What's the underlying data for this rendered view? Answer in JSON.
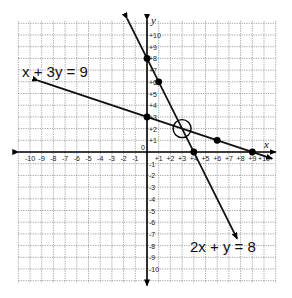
{
  "graph": {
    "x_axis_label": "x",
    "y_axis_label": "y",
    "x_range": [
      -10,
      10
    ],
    "y_range": [
      -10,
      10
    ],
    "x_ticks": [
      "-10",
      "-9",
      "-8",
      "-7",
      "-6",
      "-5",
      "-4",
      "-3",
      "-2",
      "-1",
      "+1",
      "+2",
      "+3",
      "+4",
      "+5",
      "+6",
      "+7",
      "+8",
      "+9",
      "+10"
    ],
    "y_ticks": [
      "+10",
      "+9",
      "+8",
      "+7",
      "+6",
      "+5",
      "+4",
      "+3",
      "+2",
      "+1",
      "-1",
      "-2",
      "-3",
      "-4",
      "-5",
      "-6",
      "-7",
      "-8",
      "-9",
      "-10"
    ],
    "origin_label": "0",
    "lines": [
      {
        "equation": "x + 3y = 9",
        "points": [
          [
            0,
            3
          ],
          [
            6,
            1
          ],
          [
            9,
            0
          ]
        ],
        "from": [
          -9.3,
          6.1
        ],
        "to": [
          10.7,
          -0.57
        ]
      },
      {
        "equation": "2x + y = 8",
        "points": [
          [
            0,
            8
          ],
          [
            1,
            6
          ],
          [
            4,
            0
          ]
        ],
        "from": [
          -1.7,
          11.4
        ],
        "to": [
          7.7,
          -7.4
        ]
      }
    ],
    "intersection": {
      "x": 3,
      "y": 2,
      "marker": "open-circle"
    }
  },
  "chart_data": {
    "type": "line",
    "title": "",
    "xlabel": "x",
    "ylabel": "y",
    "xlim": [
      -10,
      10
    ],
    "ylim": [
      -10,
      10
    ],
    "grid": true,
    "series": [
      {
        "name": "x + 3y = 9",
        "points": [
          [
            0,
            3
          ],
          [
            6,
            1
          ],
          [
            9,
            0
          ]
        ],
        "slope": -0.3333,
        "intercept": 3
      },
      {
        "name": "2x + y = 8",
        "points": [
          [
            0,
            8
          ],
          [
            1,
            6
          ],
          [
            4,
            0
          ]
        ],
        "slope": -2,
        "intercept": 8
      }
    ],
    "annotations": [
      {
        "text": "x + 3y = 9",
        "near": [
          -7,
          7
        ]
      },
      {
        "text": "2x + y = 8",
        "near": [
          7,
          -8
        ]
      },
      {
        "text": "intersection (circled)",
        "at": [
          3,
          2
        ]
      }
    ]
  }
}
